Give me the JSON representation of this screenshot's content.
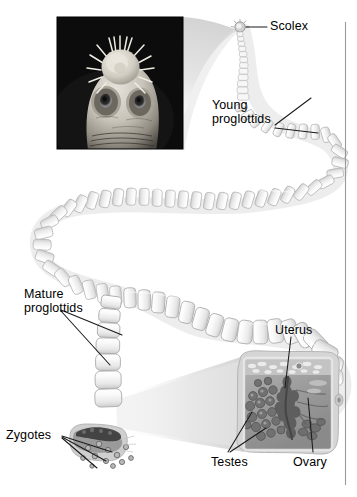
{
  "figure": {
    "background_color": "#ffffff",
    "label_color": "#000000",
    "leader_line_color": "#1a1a1a",
    "rule_color": "#9a9a9a",
    "width": 357,
    "height": 497
  },
  "labels": {
    "scolex": "Scolex",
    "young_proglottids_line1": "Young",
    "young_proglottids_line2": "proglottids",
    "mature_proglottids_line1": "Mature",
    "mature_proglottids_line2": "proglottids",
    "zygotes": "Zygotes",
    "uterus": "Uterus",
    "testes": "Testes",
    "ovary": "Ovary"
  },
  "insets": {
    "scolex_micrograph": {
      "name": "scolex-sem-photo",
      "description": "scanning electron micrograph of tapeworm scolex",
      "background_color": "#0a0a0a",
      "features": [
        "rostellum-hook-crown",
        "sucker-left",
        "sucker-right"
      ],
      "x": 57,
      "y": 17,
      "width": 126,
      "height": 132
    },
    "proglottid_section": {
      "name": "mature-proglottid-cross-section",
      "description": "magnified mature proglottid showing reproductive organs",
      "fill_color": "#9a9a9a",
      "organs": [
        "uterus",
        "testes",
        "ovary"
      ],
      "x": 236,
      "y": 350,
      "width": 104,
      "height": 108
    },
    "zygote_detail": {
      "name": "zygote-release-detail",
      "description": "gravid proglottid releasing zygotes",
      "x": 68,
      "y": 420,
      "width": 72,
      "height": 54
    }
  },
  "worm": {
    "name": "tapeworm-body",
    "segment_count_visible": 78,
    "description": "serpentine chain of proglottids increasing in size toward the posterior",
    "body_fill": "#f4f4f4",
    "body_outline": "#b8b8b8",
    "body_shadow": "#d9d9d9"
  }
}
